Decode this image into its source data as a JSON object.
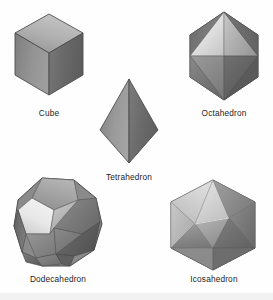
{
  "figure": {
    "name": "platonic-solids-figure",
    "background_color": "#fefefe",
    "width": 273,
    "height": 300,
    "bottom_band_color": "#f2f2f2"
  },
  "palette": {
    "outline": "#4a4a4a",
    "edge_line": "#3a3a3a",
    "highlight": "#efefef",
    "light": "#cfcfcf",
    "mid_light": "#b4b4b4",
    "mid": "#9a9a9a",
    "mid_dark": "#7f7f7f",
    "dark": "#6a6a6a",
    "darker": "#575757",
    "darkest": "#474747",
    "label_color": "#1d1d1d"
  },
  "solids": [
    {
      "id": "cube",
      "label": "Cube",
      "faces": 6,
      "face_shape": "square",
      "shading": {
        "top_face": "#a8a8a8",
        "left_face": "#8e8e8e",
        "right_face": "#6d6d6d"
      }
    },
    {
      "id": "octahedron",
      "label": "Octahedron",
      "faces": 8,
      "face_shape": "triangle",
      "shading": {
        "upper_left_face": "#767676",
        "upper_center_left_face": "#e2e2e2",
        "upper_center_right_face": "#bcbcbc",
        "upper_right_face": "#6b6b6b",
        "lower_left_face": "#8b8b8b",
        "lower_center_face": "#787878",
        "lower_right_face": "#5e5e5e"
      }
    },
    {
      "id": "tetrahedron",
      "label": "Tetrahedron",
      "faces": 4,
      "face_shape": "triangle",
      "shading": {
        "left_face": "#8f8f8f",
        "right_face": "#6f6f6f"
      }
    },
    {
      "id": "dodecahedron",
      "label": "Dodecahedron",
      "faces": 12,
      "face_shape": "pentagon",
      "shading": {
        "top_face": "#a0a0a0",
        "upper_left_face": "#e6e6e6",
        "upper_right_face": "#7a7a7a",
        "left_face": "#6f6f6f",
        "center_face": "#b9b9b9",
        "right_face": "#5f5f5f",
        "lower_left_face": "#8a8a8a",
        "lower_center_face": "#6a6a6a",
        "lower_right_face": "#7d7d7d"
      }
    },
    {
      "id": "icosahedron",
      "label": "Icosahedron",
      "faces": 20,
      "face_shape": "triangle",
      "shading": {
        "top_left_face": "#cfcfcf",
        "top_center_face": "#b0b0b0",
        "top_right_face": "#8c8c8c",
        "upper_band_light": "#dedede",
        "upper_band_mid": "#a6a6a6",
        "center_face": "#c4c4c4",
        "lower_left_face": "#9b9b9b",
        "lower_center_face": "#8a8a8a",
        "lower_right_face": "#707070",
        "bottom_face": "#787878"
      }
    }
  ]
}
